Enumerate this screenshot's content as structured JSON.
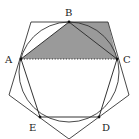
{
  "figure": {
    "colors": {
      "stroke": "#333333",
      "shade": "#9a9a9a",
      "background": "#ffffff"
    },
    "circle": {
      "cx": 69,
      "cy": 72,
      "r": 50
    },
    "points": {
      "A": {
        "label": "A",
        "x": 21,
        "y": 59,
        "label_x": 5,
        "label_y": 63
      },
      "B": {
        "label": "B",
        "x": 69,
        "y": 22,
        "label_x": 65,
        "label_y": 16
      },
      "C": {
        "label": "C",
        "x": 117,
        "y": 59,
        "label_x": 123,
        "label_y": 63
      },
      "D": {
        "label": "D",
        "x": 99,
        "y": 117,
        "label_x": 102,
        "label_y": 131
      },
      "E": {
        "label": "E",
        "x": 40,
        "y": 117,
        "label_x": 29,
        "label_y": 131
      }
    },
    "outer_pentagon": "31,22 108,22 129,95 69,139 9,95",
    "inner_pentagon": "21,59 69,22 117,59 99,117 40,117",
    "shaded_region": "21,59 69,22 108,22 117,59",
    "chord_AC": {
      "x1": 21,
      "y1": 59,
      "x2": 117,
      "y2": 59,
      "style": "dotted"
    }
  }
}
